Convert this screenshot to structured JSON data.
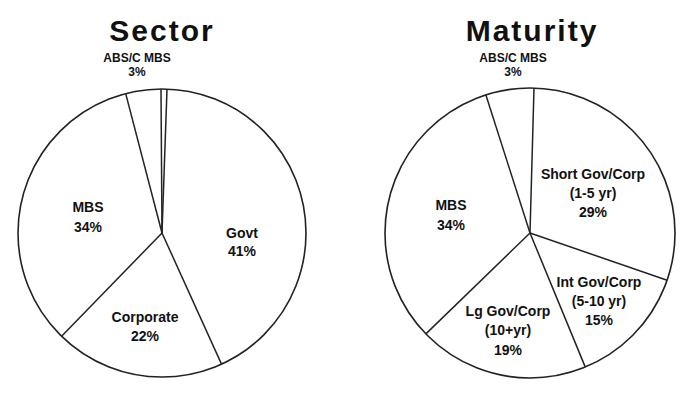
{
  "chart_data": [
    {
      "type": "pie",
      "title": "Sector",
      "categories": [
        "Govt",
        "Corporate",
        "MBS",
        "ABS/C MBS"
      ],
      "values": [
        41,
        22,
        34,
        3
      ],
      "labels": [
        "41%",
        "22%",
        "34%",
        "3%"
      ],
      "start_angle_deg": 2,
      "direction": "clockwise",
      "legend": "none",
      "render": {
        "cx": 162,
        "cy": 233,
        "r": 144,
        "boundaries_deg": [
          -0.4,
          2,
          155.6,
          224.2,
          345.4
        ],
        "label_pos": [
          [
            242,
            236
          ],
          [
            155,
            336
          ],
          [
            60,
            218
          ]
        ]
      }
    },
    {
      "type": "pie",
      "title": "Maturity",
      "categories": [
        "Short Gov/Corp (1-5 yr)",
        "Int Gov/Corp (5-10 yr)",
        "Lg Gov/Corp (10+yr)",
        "MBS",
        "ABS/C MBS"
      ],
      "values": [
        29,
        15,
        19,
        34,
        3
      ],
      "labels": [
        "29%",
        "15%",
        "19%",
        "34%",
        "3%"
      ],
      "start_angle_deg": 1.6,
      "direction": "clockwise",
      "legend": "none",
      "render": {
        "cx": 530,
        "cy": 233,
        "r": 145,
        "boundaries_deg": [
          1.6,
          109,
          157.6,
          225.9,
          342.3
        ]
      }
    }
  ],
  "sector": {
    "title": "Sector",
    "top_label": {
      "name": "ABS/C MBS",
      "pct": "3%"
    },
    "slices": [
      {
        "name": "Govt",
        "pct": "41%"
      },
      {
        "name": "Corporate",
        "pct": "22%"
      },
      {
        "name": "MBS",
        "pct": "34%"
      }
    ]
  },
  "maturity": {
    "title": "Maturity",
    "top_label": {
      "name": "ABS/C MBS",
      "pct": "3%"
    },
    "slices": [
      {
        "line1": "Short Gov/Corp",
        "line2": "(1-5 yr)",
        "pct": "29%"
      },
      {
        "line1": "Int Gov/Corp",
        "line2": "(5-10 yr)",
        "pct": "15%"
      },
      {
        "line1": "Lg Gov/Corp",
        "line2": "(10+yr)",
        "pct": "19%"
      },
      {
        "line1": "MBS",
        "pct": "34%"
      }
    ]
  }
}
